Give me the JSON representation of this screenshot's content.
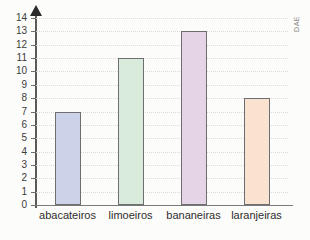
{
  "chart_data": {
    "type": "bar",
    "title": "",
    "xlabel": "",
    "ylabel": "",
    "categories": [
      "abacateiros",
      "limoeiros",
      "bananeiras",
      "laranjeiras"
    ],
    "values": [
      7,
      11,
      13,
      8
    ],
    "series": [
      {
        "name": "quantidade",
        "values": [
          7,
          11,
          13,
          8
        ]
      }
    ],
    "ylim": [
      0,
      14
    ],
    "ytick_labels": [
      "0",
      "1",
      "2",
      "3",
      "4",
      "5",
      "6",
      "7",
      "8",
      "9",
      "10",
      "11",
      "12",
      "13",
      "14"
    ],
    "ytick_values": [
      0,
      1,
      2,
      3,
      4,
      5,
      6,
      7,
      8,
      9,
      10,
      11,
      12,
      13,
      14
    ],
    "grid": true,
    "legend": "none",
    "bar_colors": [
      "#ccd2e8",
      "#d9ecdc",
      "#e5d4e6",
      "#fae2d1"
    ],
    "bar_border_color": "#6e6e72",
    "axis_color": "#5a5a5a",
    "grid_color": "#ddd9d6",
    "background_color": "#fcfcfa",
    "bars": [
      {
        "category": "abacateiros",
        "value": 7,
        "color": "#ccd2e8"
      },
      {
        "category": "limoeiros",
        "value": 11,
        "color": "#d9ecdc"
      },
      {
        "category": "bananeiras",
        "value": 13,
        "color": "#e5d4e6"
      },
      {
        "category": "laranjeiras",
        "value": 8,
        "color": "#fae2d1"
      }
    ]
  },
  "watermark": {
    "text": "DAE"
  }
}
